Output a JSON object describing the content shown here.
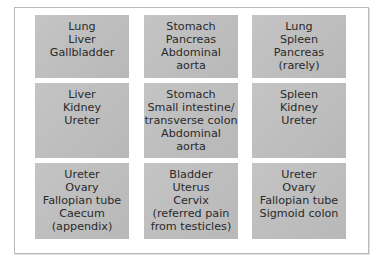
{
  "diagram": {
    "type": "grid",
    "rows": 3,
    "columns": 3,
    "colors": {
      "cell_background": "#bdbdbd",
      "text": "#2a2a2a",
      "frame_border": "#b9b9b9"
    },
    "cells": [
      {
        "row": 1,
        "col": 1,
        "lines": [
          "Lung",
          "Liver",
          "Gallbladder"
        ]
      },
      {
        "row": 1,
        "col": 2,
        "lines": [
          "Stomach",
          "Pancreas",
          "Abdominal",
          "aorta"
        ]
      },
      {
        "row": 1,
        "col": 3,
        "lines": [
          "Lung",
          "Spleen",
          "Pancreas",
          "(rarely)"
        ]
      },
      {
        "row": 2,
        "col": 1,
        "lines": [
          "Liver",
          "Kidney",
          "Ureter"
        ]
      },
      {
        "row": 2,
        "col": 2,
        "lines": [
          "Stomach",
          "Small intestine/",
          "transverse colon",
          "Abdominal",
          "aorta"
        ]
      },
      {
        "row": 2,
        "col": 3,
        "lines": [
          "Spleen",
          "Kidney",
          "Ureter"
        ]
      },
      {
        "row": 3,
        "col": 1,
        "lines": [
          "Ureter",
          "Ovary",
          "Fallopian tube",
          "Caecum",
          "(appendix)"
        ]
      },
      {
        "row": 3,
        "col": 2,
        "lines": [
          "Bladder",
          "Uterus",
          "Cervix",
          "(referred pain",
          "from testicles)"
        ]
      },
      {
        "row": 3,
        "col": 3,
        "lines": [
          "Ureter",
          "Ovary",
          "Fallopian tube",
          "Sigmoid colon"
        ]
      }
    ]
  }
}
